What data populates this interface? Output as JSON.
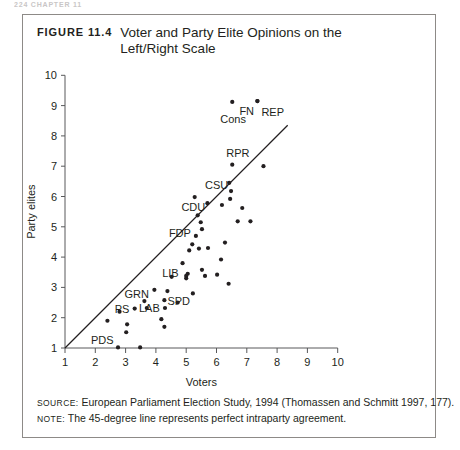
{
  "page": {
    "running_header": "224   CHAPTER 11"
  },
  "figure": {
    "number_label": "FIGURE 11.4",
    "title_line1": "Voter and Party Elite Opinions on the",
    "title_line2": "Left/Right Scale",
    "source_key": "Source:",
    "source_text": " European Parliament Election Study, 1994 (Thomassen and Schmitt 1997, 177).",
    "note_key": "Note:",
    "note_text": " The 45-degree line represents perfect intraparty agreement."
  },
  "chart_data": {
    "type": "scatter",
    "title": "Voter and Party Elite Opinions on the Left/Right Scale",
    "xlabel": "Voters",
    "ylabel": "Party elites",
    "xlim": [
      1,
      10
    ],
    "ylim": [
      1,
      10
    ],
    "xticks": [
      1,
      2,
      3,
      4,
      5,
      6,
      7,
      8,
      9,
      10
    ],
    "yticks": [
      1,
      2,
      3,
      4,
      5,
      6,
      7,
      8,
      9,
      10
    ],
    "grid": false,
    "legend": "none",
    "reference_line": {
      "name": "45-degree line",
      "description": "The 45-degree line represents perfect intraparty agreement.",
      "from": [
        1,
        1
      ],
      "to": [
        8.35,
        8.35
      ]
    },
    "points": [
      {
        "x": 2.75,
        "y": 1.02,
        "label": "PDS",
        "label_dx": -27,
        "label_dy": -3
      },
      {
        "x": 3.48,
        "y": 1.02,
        "label": null
      },
      {
        "x": 3.02,
        "y": 1.52,
        "label": null
      },
      {
        "x": 3.05,
        "y": 1.78,
        "label": null
      },
      {
        "x": 2.4,
        "y": 1.9,
        "label": null
      },
      {
        "x": 4.28,
        "y": 1.7,
        "label": null
      },
      {
        "x": 4.18,
        "y": 1.95,
        "label": null
      },
      {
        "x": 3.3,
        "y": 2.3,
        "label": "PS",
        "label_dx": -20,
        "label_dy": 4
      },
      {
        "x": 3.7,
        "y": 2.32,
        "label": null
      },
      {
        "x": 4.3,
        "y": 2.32,
        "label": "LAB",
        "label_dx": -26,
        "label_dy": 4
      },
      {
        "x": 3.62,
        "y": 2.55,
        "label": null
      },
      {
        "x": 4.28,
        "y": 2.58,
        "label": null
      },
      {
        "x": 4.72,
        "y": 2.5,
        "label": null
      },
      {
        "x": 2.8,
        "y": 2.2,
        "label": null
      },
      {
        "x": 3.95,
        "y": 2.92,
        "label": "GRN",
        "label_dx": -30,
        "label_dy": 8
      },
      {
        "x": 4.38,
        "y": 2.88,
        "label": "SPD",
        "label_dx": 0,
        "label_dy": 14
      },
      {
        "x": 5.22,
        "y": 2.8,
        "label": null
      },
      {
        "x": 5.0,
        "y": 3.3,
        "label": "LIB",
        "label_dx": -24,
        "label_dy": -1
      },
      {
        "x": 5.05,
        "y": 3.45,
        "label": null
      },
      {
        "x": 4.52,
        "y": 3.35,
        "label": null
      },
      {
        "x": 5.0,
        "y": 3.38,
        "label": null
      },
      {
        "x": 5.62,
        "y": 3.38,
        "label": null
      },
      {
        "x": 6.02,
        "y": 3.42,
        "label": null
      },
      {
        "x": 6.4,
        "y": 3.12,
        "label": null
      },
      {
        "x": 5.52,
        "y": 3.58,
        "label": null
      },
      {
        "x": 4.88,
        "y": 3.8,
        "label": null
      },
      {
        "x": 6.15,
        "y": 3.92,
        "label": null
      },
      {
        "x": 5.42,
        "y": 4.28,
        "label": null
      },
      {
        "x": 5.1,
        "y": 4.22,
        "label": null
      },
      {
        "x": 5.72,
        "y": 4.3,
        "label": null
      },
      {
        "x": 6.28,
        "y": 4.48,
        "label": null
      },
      {
        "x": 5.32,
        "y": 4.7,
        "label": "FDP",
        "label_dx": -27,
        "label_dy": 1
      },
      {
        "x": 5.2,
        "y": 4.42,
        "label": null
      },
      {
        "x": 5.52,
        "y": 4.92,
        "label": null
      },
      {
        "x": 5.48,
        "y": 5.15,
        "label": null
      },
      {
        "x": 5.38,
        "y": 5.38,
        "label": null
      },
      {
        "x": 6.7,
        "y": 5.18,
        "label": null
      },
      {
        "x": 7.12,
        "y": 5.18,
        "label": null
      },
      {
        "x": 6.85,
        "y": 5.62,
        "label": null
      },
      {
        "x": 6.18,
        "y": 5.72,
        "label": null
      },
      {
        "x": 5.7,
        "y": 5.78,
        "label": "CDU",
        "label_dx": -26,
        "label_dy": 8
      },
      {
        "x": 5.28,
        "y": 5.98,
        "label": null
      },
      {
        "x": 6.45,
        "y": 5.92,
        "label": null
      },
      {
        "x": 6.48,
        "y": 6.18,
        "label": "CSU",
        "label_dx": -26,
        "label_dy": -2
      },
      {
        "x": 6.42,
        "y": 6.45,
        "label": null
      },
      {
        "x": 7.55,
        "y": 7.0,
        "label": null
      },
      {
        "x": 6.52,
        "y": 7.05,
        "label": "RPR",
        "label_dx": -6,
        "label_dy": -8
      },
      {
        "x": 6.52,
        "y": 9.12,
        "label": "Cons",
        "label_dx": -12,
        "label_dy": 21
      },
      {
        "x": 7.35,
        "y": 9.15,
        "label": "FN",
        "label_dx": -18,
        "label_dy": 14
      },
      {
        "x": 7.35,
        "y": 9.15,
        "label": "REP",
        "label_dx": 4,
        "label_dy": 15
      }
    ]
  }
}
